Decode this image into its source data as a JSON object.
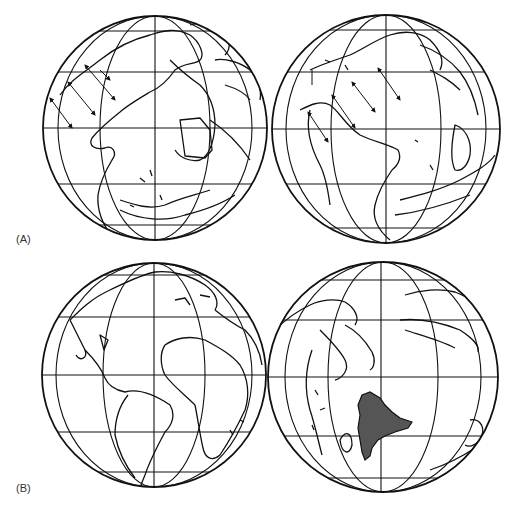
{
  "figure": {
    "panels": [
      {
        "id": "A",
        "label": "(A)",
        "globes": [
          {
            "position": "left",
            "view": "Atlantic-centered paleogeographic globe with stress arrows over North America",
            "arrow_count": 4
          },
          {
            "position": "right",
            "view": "Atlantic-centered paleogeographic globe with stress arrows over North America",
            "arrow_count": 5
          }
        ]
      },
      {
        "id": "B",
        "label": "(B)",
        "globes": [
          {
            "position": "left",
            "view": "Present-day Atlantic hemisphere (Americas, Africa, Europe)"
          },
          {
            "position": "right",
            "view": "Indian Ocean hemisphere with shaded landmass (India)",
            "highlight_color": "#555555"
          }
        ]
      }
    ],
    "colors": {
      "line": "#111111",
      "background": "#ffffff",
      "shading": "#555555"
    }
  }
}
